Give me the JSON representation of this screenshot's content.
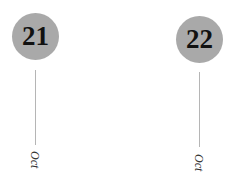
{
  "dates": [
    {
      "day": "21",
      "month": "Oct"
    },
    {
      "day": "22",
      "month": "Oct"
    }
  ]
}
